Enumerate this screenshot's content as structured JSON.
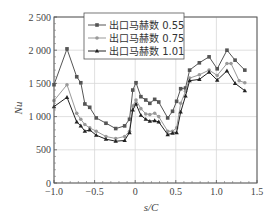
{
  "chart_data": {
    "type": "line",
    "title": "",
    "xlabel": "s/C",
    "ylabel": "Nu",
    "xlim": [
      -1.0,
      1.5
    ],
    "ylim": [
      0,
      2500
    ],
    "xticks": [
      -1.0,
      -0.5,
      0,
      0.5,
      1.0,
      1.5
    ],
    "xtick_labels": [
      "-1.0",
      "-0.5",
      "0",
      "0.5",
      "1.0",
      "1.5"
    ],
    "yticks": [
      0,
      500,
      1000,
      1500,
      2000,
      2500
    ],
    "ytick_labels": [
      "0",
      "500",
      "1 000",
      "1 500",
      "2 000",
      "2 500"
    ],
    "grid": true,
    "legend_position": "upper center",
    "series": [
      {
        "name": "出口马赫数 0.55",
        "color": "#555555",
        "marker": "square",
        "x": [
          -1.0,
          -0.84,
          -0.72,
          -0.67,
          -0.62,
          -0.56,
          -0.48,
          -0.36,
          -0.24,
          -0.13,
          -0.07,
          -0.03,
          0.01,
          0.07,
          0.13,
          0.18,
          0.24,
          0.29,
          0.4,
          0.46,
          0.51,
          0.56,
          0.62,
          0.67,
          0.79,
          0.91,
          1.01,
          1.13,
          1.23,
          1.35
        ],
        "values": [
          1480,
          2020,
          1600,
          1510,
          1190,
          1140,
          980,
          900,
          820,
          860,
          960,
          1400,
          1510,
          1300,
          1250,
          1200,
          1260,
          1220,
          980,
          1080,
          1230,
          1420,
          1430,
          1700,
          1810,
          1900,
          1720,
          2000,
          1850,
          1700
        ]
      },
      {
        "name": "出口马赫数 0.75",
        "color": "#999999",
        "marker": "circle",
        "x": [
          -1.0,
          -0.84,
          -0.72,
          -0.67,
          -0.62,
          -0.56,
          -0.48,
          -0.36,
          -0.24,
          -0.13,
          -0.07,
          -0.03,
          0.01,
          0.07,
          0.13,
          0.18,
          0.24,
          0.29,
          0.4,
          0.46,
          0.51,
          0.56,
          0.62,
          0.67,
          0.79,
          0.91,
          1.01,
          1.13,
          1.18,
          1.28,
          1.35
        ],
        "values": [
          1240,
          1480,
          1050,
          960,
          880,
          830,
          780,
          700,
          670,
          700,
          780,
          1160,
          1250,
          1120,
          1040,
          1030,
          1050,
          1000,
          780,
          780,
          830,
          1200,
          1380,
          1580,
          1630,
          1700,
          1620,
          1800,
          1800,
          1540,
          1510
        ]
      },
      {
        "name": "出口马赫数 1.01",
        "color": "#222222",
        "marker": "triangle",
        "x": [
          -1.0,
          -0.84,
          -0.72,
          -0.67,
          -0.62,
          -0.56,
          -0.48,
          -0.36,
          -0.24,
          -0.13,
          -0.07,
          -0.03,
          0.01,
          0.07,
          0.13,
          0.18,
          0.24,
          0.29,
          0.4,
          0.46,
          0.51,
          0.56,
          0.62,
          0.67,
          0.79,
          0.91,
          1.01,
          1.13,
          1.23,
          1.35
        ],
        "values": [
          1150,
          1290,
          920,
          860,
          780,
          800,
          720,
          660,
          630,
          640,
          760,
          1100,
          1190,
          1020,
          960,
          930,
          940,
          920,
          730,
          750,
          760,
          1070,
          1310,
          1540,
          1560,
          1670,
          1550,
          1690,
          1500,
          1390
        ]
      }
    ]
  },
  "legend": {
    "items": [
      "出口马赫数 0.55",
      "出口马赫数 0.75",
      "出口马赫数 1.01"
    ]
  },
  "axes": {
    "xlabel": "s/C",
    "ylabel": "Nu"
  }
}
